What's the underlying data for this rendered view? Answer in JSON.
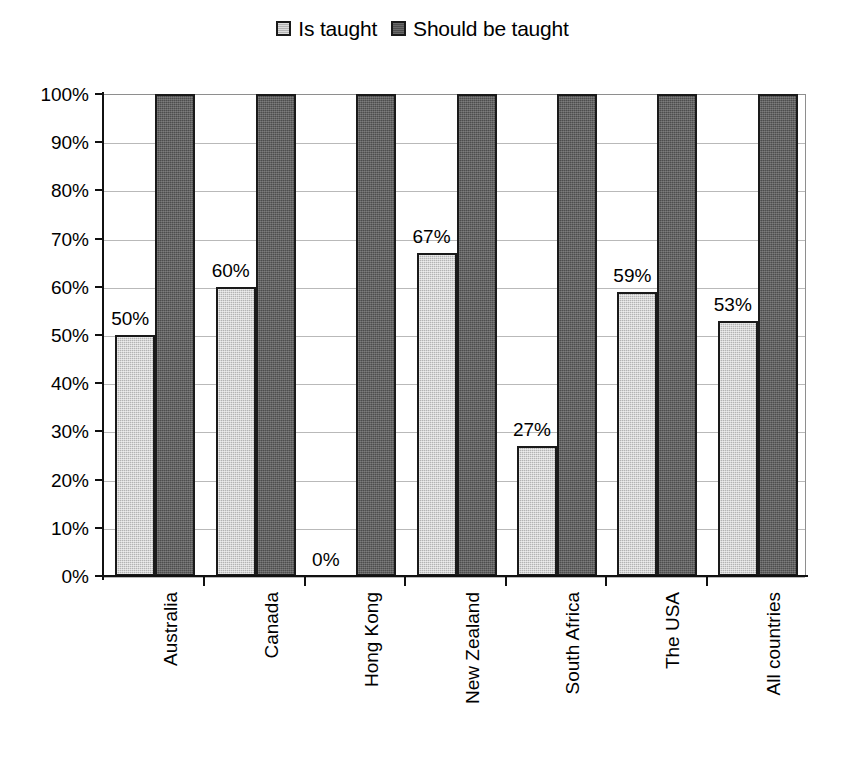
{
  "chart_data": {
    "type": "bar",
    "title": "",
    "subtitle": "",
    "xlabel": "",
    "ylabel": "",
    "ylim": [
      0,
      100
    ],
    "yticks": [
      "0%",
      "10%",
      "20%",
      "30%",
      "40%",
      "50%",
      "60%",
      "70%",
      "80%",
      "90%",
      "100%"
    ],
    "ytick_values": [
      0,
      10,
      20,
      30,
      40,
      50,
      60,
      70,
      80,
      90,
      100
    ],
    "grid": true,
    "legend_position": "top-center",
    "categories": [
      "Australia",
      "Canada",
      "Hong Kong",
      "New Zealand",
      "South Africa",
      "The USA",
      "All countries"
    ],
    "series": [
      {
        "name": "Is taught",
        "color": "#b3b3b3",
        "values": [
          50,
          60,
          0,
          67,
          27,
          59,
          53
        ],
        "data_labels": [
          "50%",
          "60%",
          "0%",
          "67%",
          "27%",
          "59%",
          "53%"
        ]
      },
      {
        "name": "Should be taught",
        "color": "#4d4d4d",
        "values": [
          100,
          100,
          100,
          100,
          100,
          100,
          100
        ],
        "data_labels": [
          "",
          "",
          "",
          "",
          "",
          "",
          ""
        ]
      }
    ]
  },
  "legend": {
    "items": [
      {
        "label": "Is taught",
        "color": "#b3b3b3"
      },
      {
        "label": "Should be taught",
        "color": "#4d4d4d"
      }
    ]
  },
  "colors": {
    "series_light": "#b3b3b3",
    "series_dark": "#4d4d4d",
    "bar_border": "#1a1a1a",
    "gridline": "#b9b9b9",
    "axis": "#111111",
    "background": "#ffffff",
    "text": "#000000"
  }
}
